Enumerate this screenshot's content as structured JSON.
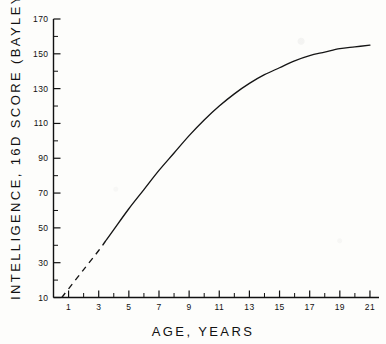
{
  "chart_data": {
    "type": "line",
    "title": "",
    "xlabel": "AGE,  YEARS",
    "ylabel": "INTELLIGENCE, 16D SCORE (BAYLEY)",
    "xlim": [
      0,
      21.6
    ],
    "ylim": [
      10,
      170
    ],
    "grid": false,
    "legend": null,
    "x_ticks": [
      1,
      3,
      5,
      7,
      9,
      11,
      13,
      15,
      17,
      19,
      21
    ],
    "x_tick_labels": [
      "1",
      "3",
      "5",
      "7",
      "9",
      "11",
      "13",
      "15",
      "17",
      "19",
      "21"
    ],
    "x_minor_step": 1,
    "y_ticks": [
      10,
      30,
      50,
      70,
      90,
      110,
      130,
      150,
      170
    ],
    "y_tick_labels": [
      "10",
      "30",
      "50",
      "70",
      "90",
      "110",
      "130",
      "150",
      "170"
    ],
    "y_minor_step": 10,
    "series": [
      {
        "name": "Mean intelligence score",
        "style": "dashed-then-solid",
        "dashed_until_x": 3.5,
        "x": [
          0.55,
          1,
          2,
          3,
          3.5,
          4,
          5,
          6,
          7,
          8,
          9,
          10,
          11,
          12,
          13,
          14,
          15,
          16,
          17,
          18,
          19,
          20,
          21
        ],
        "values": [
          10,
          15,
          26,
          37,
          43,
          49,
          61,
          72,
          83,
          93,
          103,
          112,
          120,
          127,
          133,
          138,
          142,
          146,
          149,
          151,
          153,
          154,
          155
        ]
      }
    ],
    "annotations": [
      {
        "text": "dashed segment denotes extrapolated portion below age 3.5",
        "visible": false
      }
    ]
  }
}
